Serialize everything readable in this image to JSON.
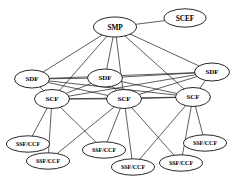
{
  "diagram": {
    "type": "node-link-graph",
    "background_color": "#ffffff",
    "line_color": "#1a1a1a",
    "node_fill_color": "#ffffff",
    "node_stroke_color": "#111111",
    "nodes": [
      {
        "id": "smp",
        "label": "SMP",
        "tier": "management",
        "cx": 115,
        "cy": 27,
        "rx": 21.5,
        "ry": 10.0
      },
      {
        "id": "scef",
        "label": "SCEF",
        "tier": "management",
        "cx": 185,
        "cy": 18,
        "rx": 21.0,
        "ry": 9.2
      },
      {
        "id": "sdf1",
        "label": "SDF",
        "tier": "data",
        "cx": 32,
        "cy": 79,
        "rx": 17.5,
        "ry": 9.0
      },
      {
        "id": "sdf2",
        "label": "SDF",
        "tier": "data",
        "cx": 105,
        "cy": 78,
        "rx": 17.5,
        "ry": 9.0
      },
      {
        "id": "sdf3",
        "label": "SDF",
        "tier": "data",
        "cx": 212,
        "cy": 72,
        "rx": 17.5,
        "ry": 9.0
      },
      {
        "id": "scf1",
        "label": "SCF",
        "tier": "control",
        "cx": 52,
        "cy": 99,
        "rx": 17.5,
        "ry": 9.5
      },
      {
        "id": "scf2",
        "label": "SCF",
        "tier": "control",
        "cx": 124,
        "cy": 99,
        "rx": 17.5,
        "ry": 9.5
      },
      {
        "id": "scf3",
        "label": "SCF",
        "tier": "control",
        "cx": 193,
        "cy": 97,
        "rx": 17.5,
        "ry": 9.5
      },
      {
        "id": "ssf1",
        "label": "SSF/CCF",
        "tier": "switching",
        "cx": 28,
        "cy": 144,
        "rx": 21.5,
        "ry": 8.2
      },
      {
        "id": "ssf2",
        "label": "SSF/CCF",
        "tier": "switching",
        "cx": 48,
        "cy": 161,
        "rx": 21.5,
        "ry": 8.2
      },
      {
        "id": "ssf3",
        "label": "SSF/CCF",
        "tier": "switching",
        "cx": 104,
        "cy": 150,
        "rx": 21.5,
        "ry": 8.2
      },
      {
        "id": "ssf4",
        "label": "SSF/CCF",
        "tier": "switching",
        "cx": 133,
        "cy": 167,
        "rx": 21.5,
        "ry": 8.2
      },
      {
        "id": "ssf5",
        "label": "SSF/CCF",
        "tier": "switching",
        "cx": 181,
        "cy": 163,
        "rx": 21.5,
        "ry": 8.2
      },
      {
        "id": "ssf6",
        "label": "SSF/CCF",
        "tier": "switching",
        "cx": 205,
        "cy": 143,
        "rx": 21.5,
        "ry": 8.2
      }
    ],
    "edges": [
      {
        "from": "smp",
        "to": "scef"
      },
      {
        "from": "smp",
        "to": "sdf1"
      },
      {
        "from": "smp",
        "to": "sdf2"
      },
      {
        "from": "smp",
        "to": "sdf3"
      },
      {
        "from": "smp",
        "to": "scf1"
      },
      {
        "from": "smp",
        "to": "scf2"
      },
      {
        "from": "smp",
        "to": "scf3"
      },
      {
        "from": "sdf1",
        "to": "sdf2"
      },
      {
        "from": "sdf2",
        "to": "sdf3"
      },
      {
        "from": "sdf1",
        "to": "sdf3"
      },
      {
        "from": "sdf1",
        "to": "scf1"
      },
      {
        "from": "sdf1",
        "to": "scf2"
      },
      {
        "from": "sdf1",
        "to": "scf3"
      },
      {
        "from": "sdf2",
        "to": "scf1"
      },
      {
        "from": "sdf2",
        "to": "scf2"
      },
      {
        "from": "sdf2",
        "to": "scf3"
      },
      {
        "from": "sdf3",
        "to": "scf1"
      },
      {
        "from": "sdf3",
        "to": "scf2"
      },
      {
        "from": "sdf3",
        "to": "scf3"
      },
      {
        "from": "scf1",
        "to": "scf2"
      },
      {
        "from": "scf2",
        "to": "scf3"
      },
      {
        "from": "scf1",
        "to": "scf3"
      },
      {
        "from": "scf1",
        "to": "ssf1"
      },
      {
        "from": "scf1",
        "to": "ssf2"
      },
      {
        "from": "scf1",
        "to": "ssf3"
      },
      {
        "from": "scf2",
        "to": "ssf3"
      },
      {
        "from": "scf2",
        "to": "ssf4"
      },
      {
        "from": "scf2",
        "to": "ssf5"
      },
      {
        "from": "scf2",
        "to": "ssf2"
      },
      {
        "from": "scf3",
        "to": "ssf5"
      },
      {
        "from": "scf3",
        "to": "ssf6"
      },
      {
        "from": "scf3",
        "to": "ssf4"
      }
    ]
  }
}
